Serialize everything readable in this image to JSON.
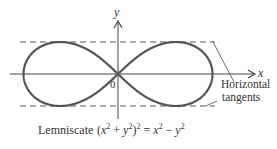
{
  "figure": {
    "axis_labels": {
      "x": "x",
      "y": "y",
      "origin": "0"
    },
    "annotation": {
      "line1": "Horizontal",
      "line2": "tangents"
    },
    "caption": {
      "prefix": "Lemniscate",
      "equation": {
        "lhs_open": "(",
        "x": "x",
        "plus": " + ",
        "y": "y",
        "close": ")",
        "exp": "2",
        "equals": " = ",
        "minus": " − "
      }
    },
    "colors": {
      "curve": "#555555",
      "axis": "#444444",
      "dashed": "#555555",
      "text": "#333333"
    }
  }
}
